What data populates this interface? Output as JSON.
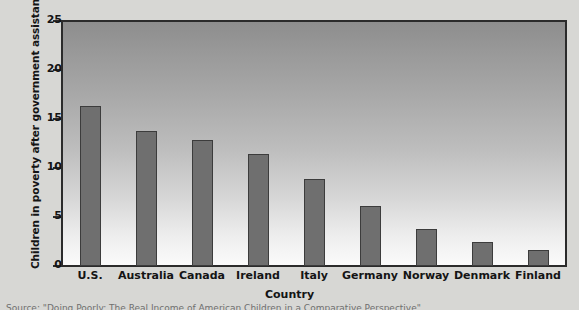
{
  "chart_data": {
    "type": "bar",
    "title": "",
    "categories": [
      "U.S.",
      "Australia",
      "Canada",
      "Ireland",
      "Italy",
      "Germany",
      "Norway",
      "Denmark",
      "Finland"
    ],
    "values": [
      16.3,
      13.8,
      12.9,
      11.4,
      8.9,
      6.1,
      3.8,
      2.5,
      1.6
    ],
    "xlabel": "Country",
    "ylabel": "Children in poverty after government assistance",
    "ylim": [
      0,
      25
    ],
    "yticks": [
      "0",
      "5",
      "10",
      "15",
      "20",
      "25"
    ],
    "ytick_values": [
      0,
      5,
      10,
      15,
      20,
      25
    ],
    "grid": false,
    "legend": "none",
    "bar_color": "#6f6f6f",
    "bar_edge_color": "#3c3c3c",
    "plot_background": "vertical gradient dark gray to white",
    "axis_color": "#2b2b2b",
    "figure_background": "#d7d7d4"
  },
  "source_note": "Source: \"Doing Poorly: The Real Income of American Children in a Comparative Perspective\""
}
